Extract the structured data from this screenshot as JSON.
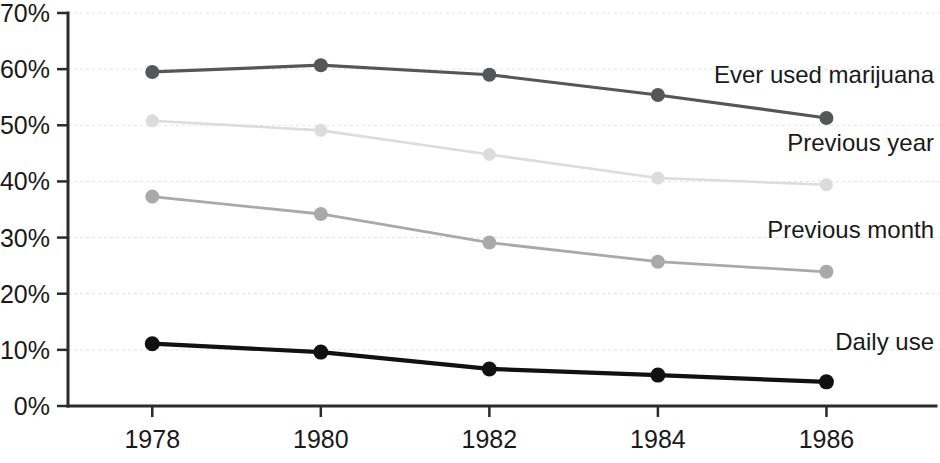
{
  "chart_data": {
    "type": "line",
    "title": "",
    "subtitle": "",
    "xlabel": "",
    "ylabel": "",
    "x": [
      1978,
      1980,
      1982,
      1984,
      1986
    ],
    "categories": [
      "1978",
      "1980",
      "1982",
      "1984",
      "1986"
    ],
    "xlim": [
      1977,
      1987
    ],
    "ylim": [
      0,
      70
    ],
    "y_ticks": [
      0,
      10,
      20,
      30,
      40,
      50,
      60,
      70
    ],
    "y_tick_labels": [
      "0%",
      "10%",
      "20%",
      "30%",
      "40%",
      "50%",
      "60%",
      "70%"
    ],
    "x_tick_labels": [
      "1978",
      "1980",
      "1982",
      "1984",
      "1986"
    ],
    "grid": true,
    "grid_axis": "y",
    "legend_position": "inline-right",
    "series": [
      {
        "name": "Ever used marijuana",
        "label": "Ever used marijuana",
        "color": "#55565a",
        "values": [
          59.5,
          60.7,
          59.0,
          55.4,
          51.3
        ]
      },
      {
        "name": "Previous year",
        "label": "Previous year",
        "color": "#dcdcdc",
        "values": [
          50.8,
          49.1,
          44.8,
          40.6,
          39.4
        ]
      },
      {
        "name": "Previous month",
        "label": "Previous month",
        "color": "#a9a9a9",
        "values": [
          37.3,
          34.2,
          29.1,
          25.7,
          23.9
        ]
      },
      {
        "name": "Daily use",
        "label": "Daily use",
        "color": "#111111",
        "values": [
          11.1,
          9.6,
          6.6,
          5.5,
          4.3
        ]
      }
    ],
    "annotations": [
      {
        "text": "Ever used marijuana",
        "series": "Ever used marijuana",
        "x": 1986,
        "y": 57.5
      },
      {
        "text": "Previous year",
        "series": "Previous year",
        "x": 1986,
        "y": 45.5
      },
      {
        "text": "Previous month",
        "series": "Previous month",
        "x": 1986,
        "y": 30.0
      },
      {
        "text": "Daily use",
        "series": "Daily use",
        "x": 1986,
        "y": 10.0
      }
    ],
    "colors": {
      "axis": "#2b2b2b",
      "grid": "#e2e2e2",
      "text": "#1a1a1a",
      "background": "#ffffff"
    }
  }
}
